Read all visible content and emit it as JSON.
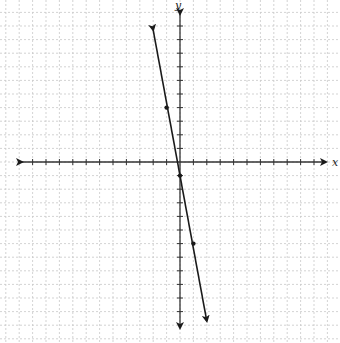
{
  "chart_data": {
    "type": "line",
    "title": "",
    "xlabel": "x",
    "ylabel": "y",
    "grid": true,
    "equation": "y = -5x - 1",
    "points": [
      {
        "x": -1,
        "y": 4
      },
      {
        "x": 0,
        "y": -1
      },
      {
        "x": 1,
        "y": -6
      }
    ],
    "line_arrow_start": {
      "x": -2,
      "y": 9.7
    },
    "line_arrow_end": {
      "x": 2,
      "y": -11.7
    },
    "xlim": [
      -12,
      11
    ],
    "ylim": [
      -12,
      11
    ]
  },
  "labels": {
    "x_axis": "x",
    "y_axis": "y"
  },
  "colors": {
    "grid": "#c8c8c8",
    "axis": "#333333",
    "line": "#1a1a1a"
  }
}
